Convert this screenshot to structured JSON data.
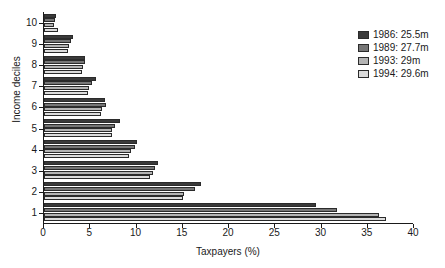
{
  "chart_data": {
    "type": "bar",
    "orientation": "horizontal",
    "title": "",
    "xlabel": "Taxpayers (%)",
    "ylabel": "Income deciles",
    "xlim": [
      0,
      40
    ],
    "xticks": [
      0,
      5,
      10,
      15,
      20,
      25,
      30,
      35,
      40
    ],
    "grid": false,
    "legend_position": "top-right",
    "categories": [
      "1",
      "2",
      "3",
      "4",
      "5",
      "6",
      "7",
      "8",
      "9",
      "10"
    ],
    "series": [
      {
        "name": "1986: 25.5m",
        "color": "#3a3a3a",
        "values": [
          29.4,
          17.0,
          12.3,
          10.1,
          8.2,
          6.6,
          5.6,
          4.4,
          3.1,
          1.3
        ]
      },
      {
        "name": "1989: 27.7m",
        "color": "#767676",
        "values": [
          31.7,
          16.3,
          12.0,
          9.8,
          7.7,
          6.7,
          5.2,
          4.4,
          2.9,
          1.2
        ]
      },
      {
        "name": "1993: 29m",
        "color": "#b4b4b4",
        "values": [
          36.2,
          15.1,
          11.8,
          9.4,
          7.4,
          6.3,
          4.9,
          4.2,
          2.7,
          1.1
        ]
      },
      {
        "name": "1994: 29.6m",
        "color": "#dcdcdc",
        "values": [
          37.0,
          15.0,
          11.5,
          9.2,
          7.3,
          6.2,
          4.8,
          4.1,
          2.6,
          1.5
        ]
      }
    ]
  },
  "legend": {
    "entries": [
      {
        "label": "1986: 25.5m",
        "color": "#3a3a3a"
      },
      {
        "label": "1989: 27.7m",
        "color": "#767676"
      },
      {
        "label": "1993: 29m",
        "color": "#b4b4b4"
      },
      {
        "label": "1994: 29.6m",
        "color": "#dcdcdc"
      }
    ]
  }
}
